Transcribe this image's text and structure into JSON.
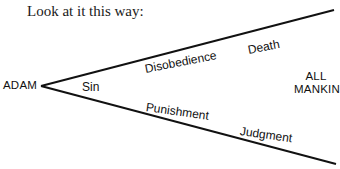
{
  "title": "Look at it this way:",
  "diagram": {
    "origin": "ADAM",
    "target": [
      "ALL",
      "MANKIND"
    ],
    "vertex_label": "Sin",
    "upper_branch": [
      "Disobedience",
      "Death"
    ],
    "lower_branch": [
      "Punishment",
      "Judgment"
    ],
    "line_color": "#111111"
  }
}
